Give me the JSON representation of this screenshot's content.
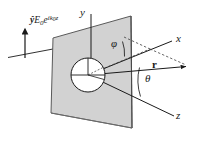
{
  "figure": {
    "canvas": {
      "width": 205,
      "height": 146,
      "background": "#ffffff"
    }
  },
  "colors": {
    "line": "#1a1a1a",
    "plane_fill": "#d2d2d2",
    "plane_stroke": "#5a5a5a",
    "dashed": "#404040",
    "text": "#1a1a1a",
    "sphere_fill": "#ffffff"
  },
  "axes": [
    {
      "name": "x-axis",
      "label": "x",
      "label_x": 176,
      "label_y": 35
    },
    {
      "name": "y-axis",
      "label": "y",
      "label_x": 80,
      "label_y": 9
    },
    {
      "name": "z-axis",
      "label": "z",
      "label_x": 176,
      "label_y": 112
    }
  ],
  "vectors": [
    {
      "name": "position-vector",
      "label": "r",
      "bold": true,
      "label_x": 152,
      "label_y": 64
    }
  ],
  "angles": [
    {
      "name": "phi",
      "label": "φ",
      "label_x": 111,
      "label_y": 44,
      "between": "x-axis and projection of r"
    },
    {
      "name": "theta",
      "label": "θ",
      "label_x": 145,
      "label_y": 78,
      "between": "z-axis and r"
    }
  ],
  "incident_wave": {
    "name": "incident-plane-wave",
    "polarization_unit_vector": "ŷ",
    "amplitude": "E",
    "amplitude_subscript": "0",
    "exponential_base": "e",
    "exponential_exponent": "ik",
    "exponential_exponent_subscript": "0",
    "exponential_exponent_variable": "z",
    "full_text": "ŷE₀e^{ik₀z}",
    "label_x": 24,
    "label_y": 18,
    "arrow_direction": "up",
    "arrow_x": 25,
    "arrow_top_y": 26,
    "arrow_bottom_y": 58
  },
  "plane": {
    "name": "incident-plane",
    "corners": [
      [
        53,
        38
      ],
      [
        131,
        16
      ],
      [
        132,
        128
      ],
      [
        51,
        113
      ]
    ],
    "fill": "#d2d2d2",
    "stroke": "#5a5a5a"
  },
  "sphere": {
    "name": "scattering-sphere",
    "center_x": 88,
    "center_y": 75,
    "radius": 17,
    "fill": "#ffffff",
    "stroke": "#1a1a1a"
  }
}
